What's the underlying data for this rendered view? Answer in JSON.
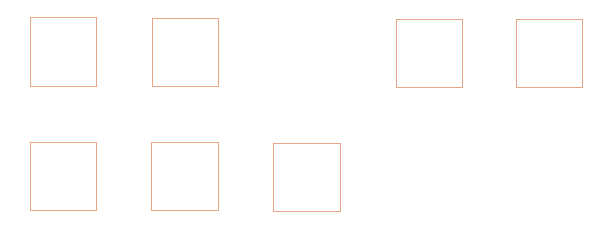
{
  "canvas": {
    "width": 614,
    "height": 238,
    "background": "#ffffff"
  },
  "style": {
    "border_color": "#e8a587",
    "border_width": 1
  },
  "boxes": [
    {
      "id": "box-1",
      "row": 1,
      "col": 1,
      "x": 30,
      "y": 17,
      "w": 67,
      "h": 70
    },
    {
      "id": "box-2",
      "row": 1,
      "col": 2,
      "x": 152,
      "y": 18,
      "w": 67,
      "h": 69
    },
    {
      "id": "box-3",
      "row": 1,
      "col": 4,
      "x": 396,
      "y": 19,
      "w": 67,
      "h": 69
    },
    {
      "id": "box-4",
      "row": 1,
      "col": 5,
      "x": 516,
      "y": 19,
      "w": 67,
      "h": 69
    },
    {
      "id": "box-5",
      "row": 2,
      "col": 1,
      "x": 30,
      "y": 142,
      "w": 67,
      "h": 69
    },
    {
      "id": "box-6",
      "row": 2,
      "col": 2,
      "x": 151,
      "y": 142,
      "w": 68,
      "h": 69
    },
    {
      "id": "box-7",
      "row": 2,
      "col": 3,
      "x": 273,
      "y": 143,
      "w": 68,
      "h": 69
    }
  ]
}
